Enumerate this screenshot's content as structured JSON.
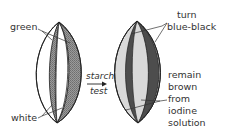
{
  "figure": {
    "type": "diagram",
    "colors": {
      "outline": "#222222",
      "green_region_hatch": "#8a8a8a",
      "blue_black": "#4a4a4a",
      "brown_light": "#d6d6d6",
      "text": "#333333"
    }
  },
  "left_leaf": {
    "labels": {
      "green": "green",
      "white": "white"
    }
  },
  "process": {
    "line1": "starch",
    "line2": "test"
  },
  "right_leaf": {
    "labels": {
      "turn_line1": "turn",
      "turn_line2": "blue-black",
      "remain_lines": [
        "remain",
        "brown",
        "from",
        "iodine",
        "solution"
      ]
    }
  }
}
